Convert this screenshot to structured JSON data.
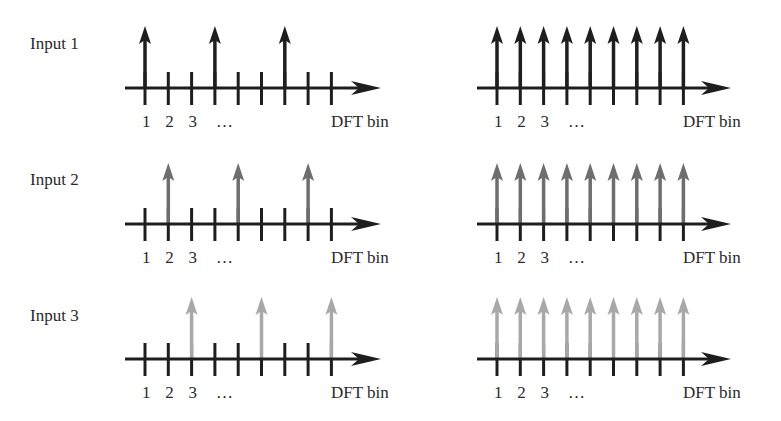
{
  "figure": {
    "axis_label": "DFT bin",
    "tick_labels": [
      "1",
      "2",
      "3",
      "…"
    ],
    "num_ticks": 9,
    "colors": {
      "axis": "#1e1e1e",
      "input1": "#1e1e1e",
      "input2": "#6e6e6e",
      "input3": "#a8a8a8"
    },
    "rows": [
      {
        "label": "Input 1",
        "left_panel": {
          "arrow_bins": [
            1,
            4,
            7
          ]
        },
        "right_panel": {
          "arrow_bins": [
            1,
            2,
            3,
            4,
            5,
            6,
            7,
            8,
            9
          ]
        }
      },
      {
        "label": "Input 2",
        "left_panel": {
          "arrow_bins": [
            2,
            5,
            8
          ]
        },
        "right_panel": {
          "arrow_bins": [
            1,
            2,
            3,
            4,
            5,
            6,
            7,
            8,
            9
          ]
        }
      },
      {
        "label": "Input 3",
        "left_panel": {
          "arrow_bins": [
            3,
            6,
            9
          ]
        },
        "right_panel": {
          "arrow_bins": [
            1,
            2,
            3,
            4,
            5,
            6,
            7,
            8,
            9
          ]
        }
      }
    ]
  }
}
